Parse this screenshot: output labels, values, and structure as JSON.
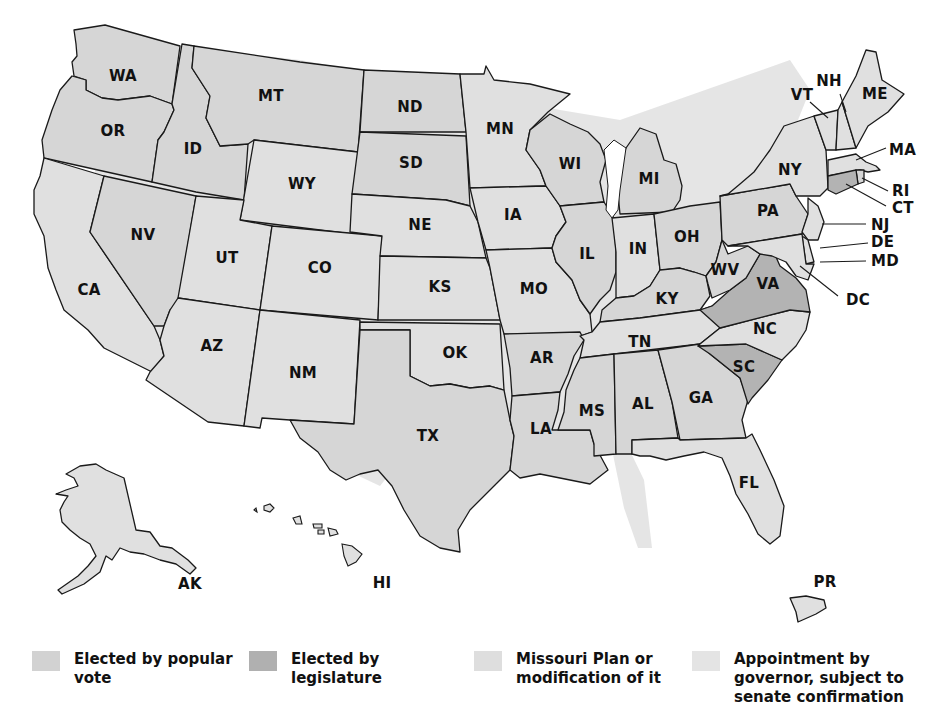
{
  "colors": {
    "popular_vote": "#d6d6d6",
    "legislature": "#b3b3b3",
    "missouri_plan": "#e0e0e0",
    "appointment": "#e6e6e6",
    "border": "#1a1a1a"
  },
  "legend": [
    {
      "id": "popular_vote",
      "label": "Elected by popular\nvote",
      "color": "#d6d6d6"
    },
    {
      "id": "legislature",
      "label": "Elected by\nlegislature",
      "color": "#b3b3b3"
    },
    {
      "id": "missouri_plan",
      "label": "Missouri Plan or\nmodification of it",
      "color": "#e0e0e0"
    },
    {
      "id": "appointment",
      "label": "Appointment by\ngovernor, subject to\nsenate confirmation",
      "color": "#e6e6e6"
    }
  ],
  "states": {
    "WA": "WA",
    "OR": "OR",
    "CA": "CA",
    "NV": "NV",
    "ID": "ID",
    "MT": "MT",
    "WY": "WY",
    "UT": "UT",
    "CO": "CO",
    "AZ": "AZ",
    "NM": "NM",
    "ND": "ND",
    "SD": "SD",
    "NE": "NE",
    "KS": "KS",
    "OK": "OK",
    "TX": "TX",
    "MN": "MN",
    "IA": "IA",
    "MO": "MO",
    "AR": "AR",
    "LA": "LA",
    "WI": "WI",
    "IL": "IL",
    "MI": "MI",
    "IN": "IN",
    "OH": "OH",
    "KY": "KY",
    "TN": "TN",
    "MS": "MS",
    "AL": "AL",
    "GA": "GA",
    "FL": "FL",
    "SC": "SC",
    "NC": "NC",
    "VA": "VA",
    "WV": "WV",
    "PA": "PA",
    "NY": "NY",
    "VT": "VT",
    "NH": "NH",
    "ME": "ME",
    "MA": "MA",
    "RI": "RI",
    "CT": "CT",
    "NJ": "NJ",
    "DE": "DE",
    "MD": "MD",
    "DC": "DC",
    "AK": "AK",
    "HI": "HI",
    "PR": "PR"
  },
  "state_categories": {
    "legislature": [
      "VA",
      "SC",
      "CT"
    ]
  }
}
